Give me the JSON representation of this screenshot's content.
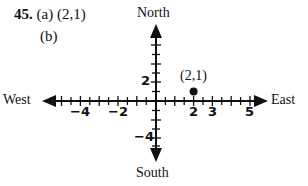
{
  "problem": {
    "number": "45.",
    "part_a_label": "(a)",
    "part_a_answer": "(2,1)",
    "part_b_label": "(b)"
  },
  "diagram": {
    "directions": {
      "north": "North",
      "south": "South",
      "east": "East",
      "west": "West"
    },
    "x_tick_labels": [
      "−4",
      "−2",
      "2",
      "3",
      "5"
    ],
    "y_tick_labels": [
      "2",
      "−4"
    ],
    "point": {
      "label": "(2,1)",
      "x": 2,
      "y": 1
    },
    "x_range": [
      -6,
      6
    ],
    "y_range": [
      -5,
      5
    ],
    "ink_color": "#111111"
  }
}
